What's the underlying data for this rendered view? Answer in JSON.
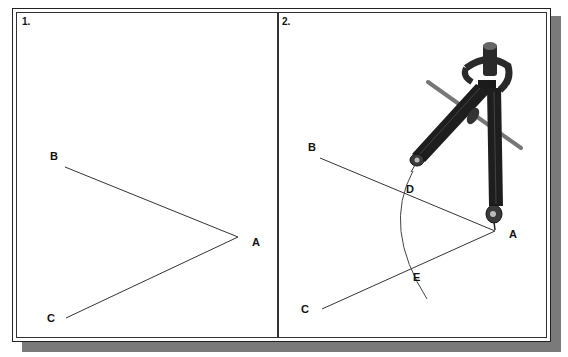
{
  "figure": {
    "panels": [
      {
        "number": "1.",
        "points": {
          "A": "A",
          "B": "B",
          "C": "C"
        },
        "description": "Angle BAC with vertex A"
      },
      {
        "number": "2.",
        "points": {
          "A": "A",
          "B": "B",
          "C": "C",
          "D": "D",
          "E": "E"
        },
        "description": "Compass centered at A draws arc intersecting AB at D and AC at E"
      }
    ],
    "colors": {
      "line": "#333333",
      "frame": "#222222",
      "shadow": "#7a7a7a",
      "compass": "#1a1a1a"
    }
  }
}
